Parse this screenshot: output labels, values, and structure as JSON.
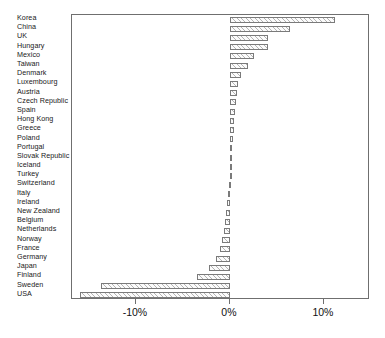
{
  "chart_data": {
    "type": "bar",
    "orientation": "horizontal",
    "title": "",
    "xlabel": "",
    "ylabel": "",
    "xlim": [
      -16.8,
      14.9
    ],
    "ylim": [
      0,
      30
    ],
    "grid": false,
    "legend": null,
    "xtick_labels": [
      "-10%",
      "0%",
      "10%"
    ],
    "xtick_values": [
      -10,
      0,
      10
    ],
    "categories": [
      "Korea",
      "China",
      "UK",
      "Hungary",
      "Mexico",
      "Taiwan",
      "Denmark",
      "Luxembourg",
      "Austria",
      "Czech Republic",
      "Spain",
      "Hong Kong",
      "Greece",
      "Poland",
      "Portugal",
      "Slovak Republic",
      "Iceland",
      "Turkey",
      "Switzerland",
      "Italy",
      "Ireland",
      "New Zealand",
      "Belgium",
      "Netherlands",
      "Norway",
      "France",
      "Germany",
      "Japan",
      "Finland",
      "Sweden",
      "USA"
    ],
    "values": [
      11.2,
      6.4,
      4.1,
      4.0,
      2.6,
      1.9,
      1.2,
      0.9,
      0.7,
      0.6,
      0.5,
      0.45,
      0.4,
      0.3,
      0.25,
      0.2,
      0.1,
      0.0,
      -0.1,
      -0.2,
      -0.3,
      -0.4,
      -0.5,
      -0.6,
      -0.8,
      -1.1,
      -1.5,
      -2.2,
      -3.5,
      -13.7,
      -16.0
    ],
    "value_unit": "%",
    "bar_fill": "#fbfbfb",
    "bar_hatch": "/",
    "bar_edge_color": "#7a7a7a",
    "axis_color": "#6f6f6f",
    "background_color": "#ffffff"
  }
}
